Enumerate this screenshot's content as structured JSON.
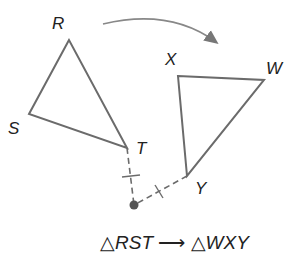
{
  "figure": {
    "type": "rotation",
    "preimage": {
      "name": "RST",
      "vertices": [
        {
          "label": "R",
          "x": 69,
          "y": 40
        },
        {
          "label": "S",
          "x": 29,
          "y": 114
        },
        {
          "label": "T",
          "x": 127,
          "y": 148
        }
      ]
    },
    "image": {
      "name": "WXY",
      "vertices": [
        {
          "label": "X",
          "x": 178,
          "y": 76
        },
        {
          "label": "W",
          "x": 264,
          "y": 80
        },
        {
          "label": "Y",
          "x": 187,
          "y": 176
        }
      ]
    },
    "center_of_rotation": {
      "x": 134,
      "y": 205
    },
    "caption": {
      "triangle_symbol": "△",
      "from": "RST",
      "arrow": "⟶",
      "to": "WXY"
    },
    "colors": {
      "stroke": "#6b6b6b",
      "text": "#222222",
      "point": "#555555"
    }
  }
}
